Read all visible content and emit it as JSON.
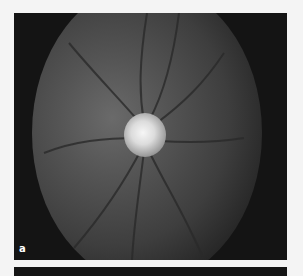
{
  "figure": {
    "panel_a": {
      "label": "a",
      "description": "Fundus photograph of optic disc with retinal vessels"
    },
    "panel_b": {
      "visible": "top edge only"
    }
  }
}
